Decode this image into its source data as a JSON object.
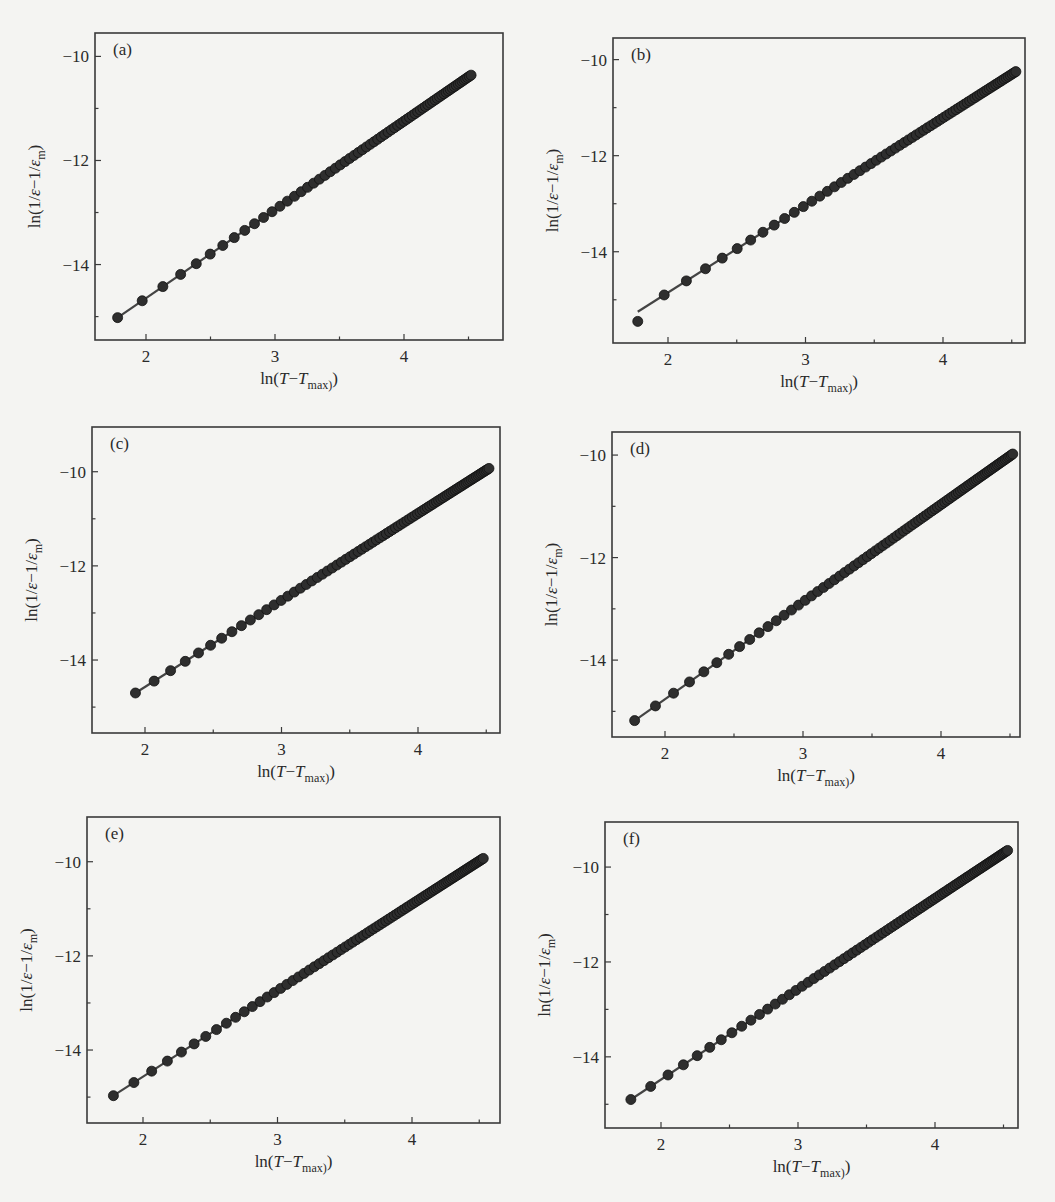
{
  "figure": {
    "panel_count": 6,
    "colors": {
      "axis": "#3a3a3a",
      "marker": "#2e2e2e",
      "line": "#444444",
      "background": "#f4f4f2"
    }
  },
  "chart_data": [
    {
      "type": "scatter",
      "panel_label": "(a)",
      "title": "",
      "xlabel": "ln(T−T_max)",
      "ylabel": "ln(1/ε−1/ε_m)",
      "xticks": [
        "2",
        "3",
        "4"
      ],
      "yticks": [
        "−10",
        "−12",
        "−14"
      ],
      "xlim": [
        1.6,
        4.75
      ],
      "ylim": [
        -15.45,
        -9.55
      ],
      "grid": false,
      "legend": null,
      "fit_line": {
        "x_start": 1.78,
        "y_start": -15.02,
        "x_end": 4.52,
        "y_end": -10.36
      },
      "series": [
        {
          "name": "data",
          "marker": "filled-circle",
          "x_start": 1.78,
          "x_end": 4.52,
          "y_start": -15.02,
          "y_end": -10.36,
          "n_points": 70
        }
      ],
      "note": "Point-by-point values are reconstructed from the fitted line and visible spacing, not digitized from each marker."
    },
    {
      "type": "scatter",
      "panel_label": "(b)",
      "title": "",
      "xlabel": "ln(T−T_max)",
      "ylabel": "ln(1/ε−1/ε_m)",
      "xticks": [
        "2",
        "3",
        "4"
      ],
      "yticks": [
        "−10",
        "−12",
        "−14"
      ],
      "xlim": [
        1.6,
        4.6
      ],
      "ylim": [
        -15.9,
        -9.55
      ],
      "grid": false,
      "legend": null,
      "fit_line": {
        "x_start": 1.78,
        "y_start": -15.25,
        "x_end": 4.53,
        "y_end": -10.25
      },
      "series": [
        {
          "name": "data",
          "marker": "filled-circle",
          "x_start": 1.78,
          "x_end": 4.53,
          "y_start": -15.45,
          "y_end": -10.25,
          "n_points": 70
        }
      ],
      "note": "Point-by-point values are reconstructed from the fitted line and visible spacing, not digitized from each marker."
    },
    {
      "type": "scatter",
      "panel_label": "(c)",
      "title": "",
      "xlabel": "ln(T−T_max)",
      "ylabel": "ln(1/ε−1/ε_m)",
      "xticks": [
        "2",
        "3",
        "4"
      ],
      "yticks": [
        "−10",
        "−12",
        "−14"
      ],
      "xlim": [
        1.6,
        4.58
      ],
      "ylim": [
        -15.55,
        -9.05
      ],
      "grid": false,
      "legend": null,
      "fit_line": {
        "x_start": 1.93,
        "y_start": -14.7,
        "x_end": 4.52,
        "y_end": -9.93
      },
      "series": [
        {
          "name": "data",
          "marker": "filled-circle",
          "x_start": 1.93,
          "x_end": 4.52,
          "y_start": -14.7,
          "y_end": -9.93,
          "n_points": 85
        }
      ],
      "note": "Point-by-point values are reconstructed from the fitted line and visible spacing, not digitized from each marker."
    },
    {
      "type": "scatter",
      "panel_label": "(d)",
      "title": "",
      "xlabel": "ln(T−T_max)",
      "ylabel": "ln(1/ε−1/ε_m)",
      "xticks": [
        "2",
        "3",
        "4"
      ],
      "yticks": [
        "−10",
        "−12",
        "−14"
      ],
      "xlim": [
        1.58,
        4.58
      ],
      "ylim": [
        -15.5,
        -9.55
      ],
      "grid": false,
      "legend": null,
      "fit_line": {
        "x_start": 1.78,
        "y_start": -15.18,
        "x_end": 4.52,
        "y_end": -9.98
      },
      "series": [
        {
          "name": "data",
          "marker": "filled-circle",
          "x_start": 1.78,
          "x_end": 4.52,
          "y_start": -15.18,
          "y_end": -9.98,
          "n_points": 90
        }
      ],
      "note": "Point-by-point values are reconstructed from the fitted line and visible spacing, not digitized from each marker."
    },
    {
      "type": "scatter",
      "panel_label": "(e)",
      "title": "",
      "xlabel": "ln(T−T_max)",
      "ylabel": "ln(1/ε−1/ε_m)",
      "xticks": [
        "2",
        "3",
        "4"
      ],
      "yticks": [
        "−10",
        "−12",
        "−14"
      ],
      "xlim": [
        1.58,
        4.6
      ],
      "ylim": [
        -15.55,
        -9.05
      ],
      "grid": false,
      "legend": null,
      "fit_line": {
        "x_start": 1.78,
        "y_start": -14.97,
        "x_end": 4.53,
        "y_end": -9.93
      },
      "series": [
        {
          "name": "data",
          "marker": "filled-circle",
          "x_start": 1.78,
          "x_end": 4.53,
          "y_start": -14.97,
          "y_end": -9.93,
          "n_points": 90
        }
      ],
      "note": "Point-by-point values are reconstructed from the fitted line and visible spacing, not digitized from each marker."
    },
    {
      "type": "scatter",
      "panel_label": "(f)",
      "title": "",
      "xlabel": "ln(T−T_max)",
      "ylabel": "ln(1/ε−1/ε_m)",
      "xticks": [
        "2",
        "3",
        "4"
      ],
      "yticks": [
        "−10",
        "−12",
        "−14"
      ],
      "xlim": [
        1.58,
        4.6
      ],
      "ylim": [
        -15.5,
        -9.05
      ],
      "grid": false,
      "legend": null,
      "fit_line": {
        "x_start": 1.78,
        "y_start": -14.9,
        "x_end": 4.53,
        "y_end": -9.65
      },
      "series": [
        {
          "name": "data",
          "marker": "filled-circle",
          "x_start": 1.78,
          "x_end": 4.53,
          "y_start": -14.9,
          "y_end": -9.65,
          "n_points": 95
        }
      ],
      "note": "Point-by-point values are reconstructed from the fitted line and visible spacing, not digitized from each marker."
    }
  ],
  "layout_px": [
    {
      "left": 95,
      "top": 33,
      "right": 503,
      "bottom": 340,
      "x2_px": 146,
      "x4_px": 404
    },
    {
      "left": 613,
      "top": 38,
      "right": 1025,
      "bottom": 343,
      "x2_px": 668,
      "x4_px": 943
    },
    {
      "left": 92,
      "top": 427,
      "right": 500,
      "bottom": 733,
      "x2_px": 145,
      "x4_px": 418
    },
    {
      "left": 612,
      "top": 432,
      "right": 1020,
      "bottom": 737,
      "x2_px": 665,
      "x4_px": 941
    },
    {
      "left": 87,
      "top": 817,
      "right": 500,
      "bottom": 1123,
      "x2_px": 143,
      "x4_px": 412
    },
    {
      "left": 605,
      "top": 822,
      "right": 1018,
      "bottom": 1128,
      "x2_px": 661,
      "x4_px": 935
    }
  ]
}
